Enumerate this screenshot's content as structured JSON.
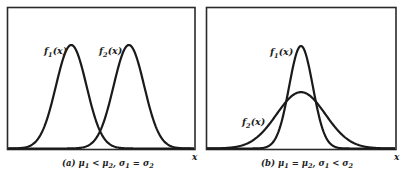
{
  "chart_data": [
    {
      "type": "line",
      "panel": "a",
      "caption": "(a) μ₁ < μ₂, σ₁ = σ₂",
      "caption_parts": {
        "prefix": "(a) ",
        "mu1": "μ",
        "s1": "1",
        "rel1": " < ",
        "mu2": "μ",
        "s2": "2",
        "sep": ", ",
        "sig1": "σ",
        "s3": "1",
        "rel2": " = ",
        "sig2": "σ",
        "s4": "2"
      },
      "xlabel": "x",
      "ylabel": "",
      "grid": false,
      "legend": "inline labels",
      "series": [
        {
          "name": "f1(x)",
          "label_main": "f",
          "label_sub": "1",
          "label_arg": "(x)",
          "mean": 0.34,
          "sigma": 0.082,
          "peak": 1.0
        },
        {
          "name": "f2(x)",
          "label_main": "f",
          "label_sub": "2",
          "label_arg": "(x)",
          "mean": 0.65,
          "sigma": 0.082,
          "peak": 1.0
        }
      ]
    },
    {
      "type": "line",
      "panel": "b",
      "caption": "(b) μ₁ = μ₂, σ₁ < σ₂",
      "caption_parts": {
        "prefix": "(b) ",
        "mu1": "μ",
        "s1": "1",
        "rel1": " = ",
        "mu2": "μ",
        "s2": "2",
        "sep": ", ",
        "sig1": "σ",
        "s3": "1",
        "rel2": " < ",
        "sig2": "σ",
        "s4": "2"
      },
      "xlabel": "x",
      "ylabel": "",
      "grid": false,
      "legend": "inline labels",
      "series": [
        {
          "name": "f1(x)",
          "label_main": "f",
          "label_sub": "1",
          "label_arg": "(x)",
          "mean": 0.5,
          "sigma": 0.063,
          "peak": 1.0
        },
        {
          "name": "f2(x)",
          "label_main": "f",
          "label_sub": "2",
          "label_arg": "(x)",
          "mean": 0.5,
          "sigma": 0.13,
          "peak": 0.55
        }
      ]
    }
  ],
  "colors": {
    "line": "#1a1a1a",
    "frame": "#2a2a2a",
    "background": "#ffffff"
  }
}
